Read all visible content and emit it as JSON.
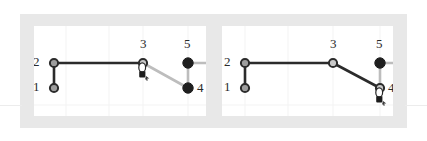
{
  "figure": {
    "type": "node-link-interaction",
    "width": 427,
    "height": 141,
    "background_color": "#ffffff",
    "frame_color": "#e8e8e8",
    "panel_background": "#ffffff",
    "gridline_color": "#f2f2f2",
    "edge_active_color": "#2b2b2b",
    "edge_inactive_color": "#b9b9b9",
    "node_outline_color": "#2b2b2b",
    "node_open_fill": "#a9a9a9",
    "node_solid_fill": "#1f1f1f",
    "label_color": "#2a2a2a"
  },
  "panels": [
    {
      "id": "panel-before",
      "name": "left-panel",
      "cursor": {
        "name": "hand-cursor",
        "x": 144,
        "y": 72,
        "over_node": "3"
      },
      "nodes": [
        {
          "id": "1",
          "label": "1",
          "x": 54,
          "y": 88,
          "style": "open",
          "label_x": 33,
          "label_y": 82
        },
        {
          "id": "2",
          "label": "2",
          "x": 54,
          "y": 63,
          "style": "open",
          "label_x": 33,
          "label_y": 57
        },
        {
          "id": "3",
          "label": "3",
          "x": 143,
          "y": 63,
          "style": "open",
          "label_x": 140,
          "label_y": 40
        },
        {
          "id": "4",
          "label": "4",
          "x": 188,
          "y": 88,
          "style": "solid",
          "label_x": 196,
          "label_y": 82
        },
        {
          "id": "5",
          "label": "5",
          "x": 188,
          "y": 63,
          "style": "solid",
          "label_x": 184,
          "label_y": 40
        }
      ],
      "edges": [
        {
          "from": "1",
          "to": "2",
          "state": "active"
        },
        {
          "from": "2",
          "to": "3",
          "state": "active"
        },
        {
          "from": "3",
          "to": "4",
          "state": "inactive"
        },
        {
          "from": "4",
          "to": "5",
          "state": "inactive"
        },
        {
          "from": "5",
          "to": "edge-right",
          "state": "inactive"
        }
      ]
    },
    {
      "id": "panel-after",
      "name": "right-panel",
      "cursor": {
        "name": "hand-cursor",
        "x": 382,
        "y": 96,
        "over_node": "4"
      },
      "nodes": [
        {
          "id": "1",
          "label": "1",
          "x": 245,
          "y": 88,
          "style": "open",
          "label_x": 224,
          "label_y": 82
        },
        {
          "id": "2",
          "label": "2",
          "x": 245,
          "y": 63,
          "style": "open",
          "label_x": 224,
          "label_y": 57
        },
        {
          "id": "3",
          "label": "3",
          "x": 333,
          "y": 63,
          "style": "open",
          "label_x": 330,
          "label_y": 40
        },
        {
          "id": "4",
          "label": "4",
          "x": 380,
          "y": 88,
          "style": "open",
          "label_x": 388,
          "label_y": 82
        },
        {
          "id": "5",
          "label": "5",
          "x": 380,
          "y": 63,
          "style": "solid",
          "label_x": 376,
          "label_y": 40
        }
      ],
      "edges": [
        {
          "from": "1",
          "to": "2",
          "state": "active"
        },
        {
          "from": "2",
          "to": "3",
          "state": "active"
        },
        {
          "from": "3",
          "to": "4",
          "state": "active"
        },
        {
          "from": "4",
          "to": "5",
          "state": "inactive"
        },
        {
          "from": "5",
          "to": "edge-right",
          "state": "inactive"
        }
      ]
    }
  ],
  "labels": {
    "n1": "1",
    "n2": "2",
    "n3": "3",
    "n4": "4",
    "n5": "5"
  }
}
